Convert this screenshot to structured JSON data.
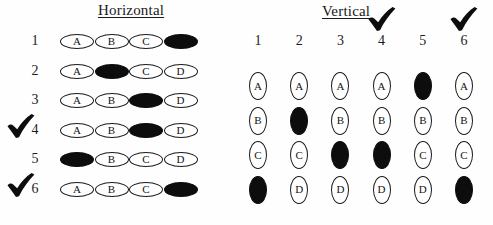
{
  "page": {
    "background_color": "#fefefe",
    "ink_color": "#0d0d0d"
  },
  "sections": {
    "horizontal": {
      "title": "Horizontal",
      "orientation": "horizontal",
      "options": [
        "A",
        "B",
        "C",
        "D"
      ],
      "rows": [
        {
          "number": "1",
          "filled": "D",
          "checked": false,
          "checkmark": ""
        },
        {
          "number": "2",
          "filled": "B",
          "checked": false,
          "checkmark": ""
        },
        {
          "number": "3",
          "filled": "C",
          "checked": false,
          "checkmark": ""
        },
        {
          "number": "4",
          "filled": "C",
          "checked": true,
          "checkmark": "check-mark"
        },
        {
          "number": "5",
          "filled": "A",
          "checked": false,
          "checkmark": ""
        },
        {
          "number": "6",
          "filled": "D",
          "checked": true,
          "checkmark": "check-mark"
        }
      ]
    },
    "vertical": {
      "title": "Vertical",
      "orientation": "vertical",
      "options": [
        "A",
        "B",
        "C",
        "D"
      ],
      "columns": [
        {
          "number": "1",
          "filled": "D",
          "checked": false,
          "checkmark": ""
        },
        {
          "number": "2",
          "filled": "B",
          "checked": false,
          "checkmark": ""
        },
        {
          "number": "3",
          "filled": "C",
          "checked": false,
          "checkmark": ""
        },
        {
          "number": "4",
          "filled": "C",
          "checked": true,
          "checkmark": "check-mark"
        },
        {
          "number": "5",
          "filled": "A",
          "checked": false,
          "checkmark": ""
        },
        {
          "number": "6",
          "filled": "D",
          "checked": true,
          "checkmark": "check-mark"
        }
      ]
    }
  }
}
